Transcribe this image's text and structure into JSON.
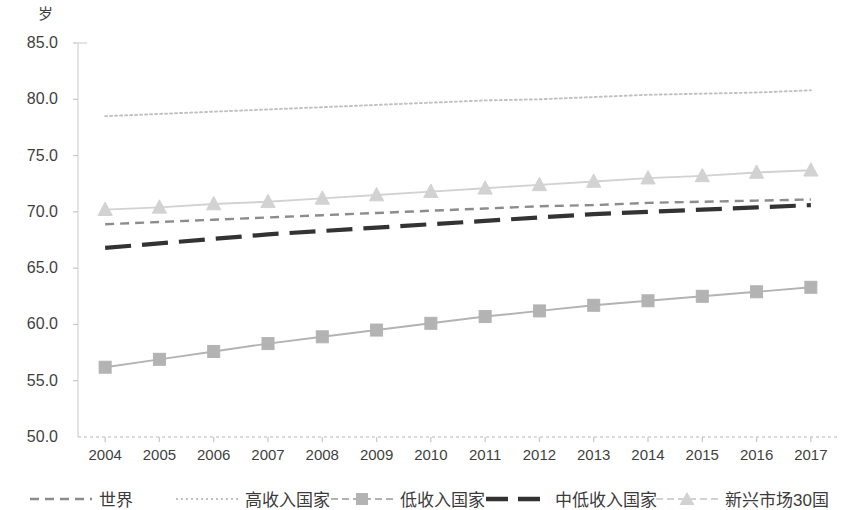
{
  "axis": {
    "y_unit_label": "岁",
    "y_ticks": [
      "85.0",
      "80.0",
      "75.0",
      "70.0",
      "65.0",
      "60.0",
      "55.0",
      "50.0"
    ],
    "x_ticks": [
      "2004",
      "2005",
      "2006",
      "2007",
      "2008",
      "2009",
      "2010",
      "2011",
      "2012",
      "2013",
      "2014",
      "2015",
      "2016",
      "2017"
    ]
  },
  "legend": {
    "items": [
      {
        "label": "世界",
        "key": "dashed-line",
        "color": "#8c8c8c"
      },
      {
        "label": "高收入国家",
        "key": "dotted-line",
        "color": "#c0c0c0"
      },
      {
        "label": "低收入国家",
        "key": "line-square-marker",
        "color": "#b3b3b3"
      },
      {
        "label": "中低收入国家",
        "key": "thick-dashed-line",
        "color": "#333333"
      },
      {
        "label": "新兴市场30国",
        "key": "line-triangle-marker",
        "color": "#d2d2d2"
      }
    ]
  },
  "chart_data": {
    "type": "line",
    "title": "",
    "xlabel": "",
    "ylabel": "岁",
    "ylim": [
      50.0,
      85.0
    ],
    "ytick_step": 5.0,
    "grid": false,
    "legend_position": "bottom",
    "x": [
      2004,
      2005,
      2006,
      2007,
      2008,
      2009,
      2010,
      2011,
      2012,
      2013,
      2014,
      2015,
      2016,
      2017
    ],
    "series": [
      {
        "name": "高收入国家",
        "style": "dotted",
        "color": "#c0c0c0",
        "marker": "none",
        "values": [
          78.5,
          78.7,
          78.9,
          79.1,
          79.3,
          79.5,
          79.7,
          79.9,
          80.0,
          80.2,
          80.4,
          80.5,
          80.6,
          80.8
        ]
      },
      {
        "name": "新兴市场30国",
        "style": "solid",
        "color": "#d2d2d2",
        "marker": "triangle",
        "values": [
          70.2,
          70.4,
          70.7,
          70.9,
          71.2,
          71.5,
          71.8,
          72.1,
          72.4,
          72.7,
          73.0,
          73.2,
          73.5,
          73.7
        ]
      },
      {
        "name": "世界",
        "style": "dashed",
        "color": "#8c8c8c",
        "marker": "none",
        "values": [
          68.9,
          69.1,
          69.3,
          69.5,
          69.7,
          69.9,
          70.1,
          70.3,
          70.5,
          70.6,
          70.8,
          70.9,
          71.0,
          71.1
        ]
      },
      {
        "name": "中低收入国家",
        "style": "thick-dashed",
        "color": "#333333",
        "marker": "none",
        "values": [
          66.8,
          67.2,
          67.6,
          68.0,
          68.3,
          68.6,
          68.9,
          69.2,
          69.5,
          69.8,
          70.0,
          70.2,
          70.4,
          70.6
        ]
      },
      {
        "name": "低收入国家",
        "style": "solid",
        "color": "#b3b3b3",
        "marker": "square",
        "values": [
          56.2,
          56.9,
          57.6,
          58.3,
          58.9,
          59.5,
          60.1,
          60.7,
          61.2,
          61.7,
          62.1,
          62.5,
          62.9,
          63.3
        ]
      }
    ]
  }
}
